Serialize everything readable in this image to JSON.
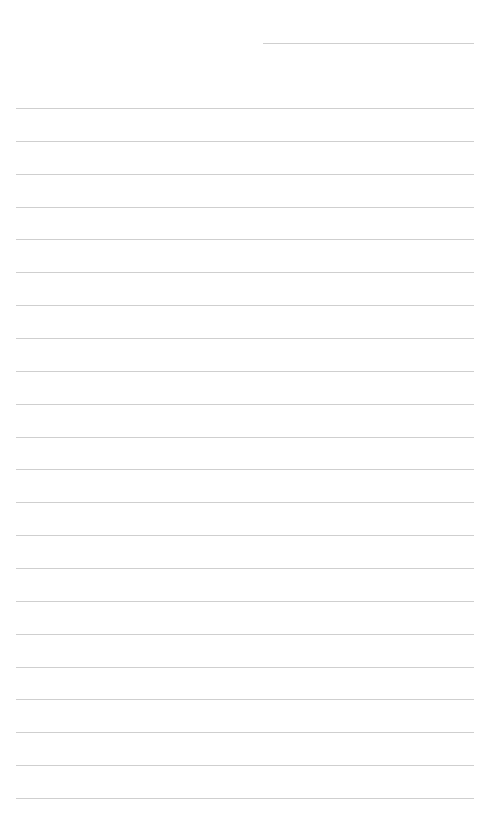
{
  "page": {
    "type": "lined-notepaper",
    "background_color": "#ffffff",
    "line_color": "#cfcfcf",
    "header_line": {
      "x": 263,
      "y": 43,
      "width": 211
    },
    "rules": {
      "count": 22,
      "first_y": 108,
      "spacing": 32.86,
      "x": 16,
      "width": 458
    }
  }
}
